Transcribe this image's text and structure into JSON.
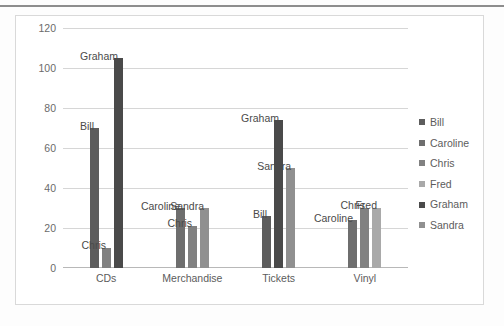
{
  "chart_data": {
    "type": "bar",
    "title": "",
    "xlabel": "",
    "ylabel": "",
    "ylim": [
      0,
      120
    ],
    "ytick_labels": [
      "0",
      "20",
      "40",
      "60",
      "80",
      "100",
      "120"
    ],
    "ytick_values": [
      0,
      20,
      40,
      60,
      80,
      100,
      120
    ],
    "grid": true,
    "legend_position": "right",
    "categories": [
      "CDs",
      "Merchandise",
      "Tickets",
      "Vinyl"
    ],
    "legend": [
      "Bill",
      "Caroline",
      "Chris",
      "Fred",
      "Graham",
      "Sandra"
    ],
    "series": [
      {
        "name": "Bill",
        "color": "#5d5d5d"
      },
      {
        "name": "Caroline",
        "color": "#6e6e6e"
      },
      {
        "name": "Chris",
        "color": "#818181"
      },
      {
        "name": "Fred",
        "color": "#a9a9a9"
      },
      {
        "name": "Graham",
        "color": "#4a4a4a"
      },
      {
        "name": "Sandra",
        "color": "#909090"
      }
    ],
    "bars": [
      {
        "category": "CDs",
        "series": "Bill",
        "value": 70,
        "label": "Bill",
        "color": "#5d5d5d"
      },
      {
        "category": "CDs",
        "series": "Chris",
        "value": 10,
        "label": "Chris",
        "color": "#818181"
      },
      {
        "category": "CDs",
        "series": "Graham",
        "value": 105,
        "label": "Graham",
        "color": "#4a4a4a"
      },
      {
        "category": "Merchandise",
        "series": "Caroline",
        "value": 30,
        "label": "Caroline",
        "color": "#6e6e6e"
      },
      {
        "category": "Merchandise",
        "series": "Chris",
        "value": 21,
        "label": "Chris",
        "color": "#818181"
      },
      {
        "category": "Merchandise",
        "series": "Sandra",
        "value": 30,
        "label": "Sandra",
        "color": "#909090"
      },
      {
        "category": "Tickets",
        "series": "Bill",
        "value": 26,
        "label": "Bill",
        "color": "#5d5d5d"
      },
      {
        "category": "Tickets",
        "series": "Graham",
        "value": 74,
        "label": "Graham",
        "color": "#4a4a4a"
      },
      {
        "category": "Tickets",
        "series": "Sandra",
        "value": 50,
        "label": "Sandra",
        "color": "#909090"
      },
      {
        "category": "Vinyl",
        "series": "Caroline",
        "value": 24,
        "label": "Caroline",
        "color": "#6e6e6e"
      },
      {
        "category": "Vinyl",
        "series": "Chris",
        "value": 30,
        "label": "Chris",
        "color": "#818181"
      },
      {
        "category": "Vinyl",
        "series": "Fred",
        "value": 30,
        "label": "Fred",
        "color": "#a9a9a9"
      }
    ]
  }
}
